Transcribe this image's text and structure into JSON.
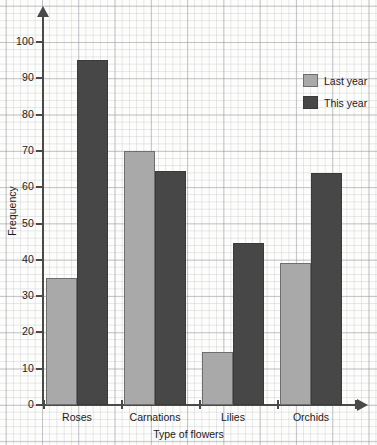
{
  "chart_data": {
    "type": "bar",
    "title": "",
    "xlabel": "Type of flowers",
    "ylabel": "Frequency",
    "categories": [
      "Roses",
      "Carnations",
      "Lilies",
      "Orchids"
    ],
    "series": [
      {
        "name": "Last year",
        "color": "#a9a9a9",
        "values": [
          35,
          70,
          14.5,
          39
        ]
      },
      {
        "name": "This year",
        "color": "#474747",
        "values": [
          95,
          64.5,
          44.5,
          64
        ]
      }
    ],
    "ylim": [
      0,
      105
    ],
    "ytick_labels": [
      "0",
      "10",
      "20",
      "30",
      "40",
      "50",
      "60",
      "70",
      "80",
      "90",
      "100"
    ],
    "ytick_values": [
      0,
      10,
      20,
      30,
      40,
      50,
      60,
      70,
      80,
      90,
      100
    ],
    "grid": "graph-paper",
    "legend_position": "top-right",
    "axis_arrows": true
  },
  "legend": {
    "entries": [
      {
        "label": "Last year"
      },
      {
        "label": "This year"
      }
    ]
  },
  "axes": {
    "y_title": "Frequency",
    "x_title": "Type of flowers"
  }
}
